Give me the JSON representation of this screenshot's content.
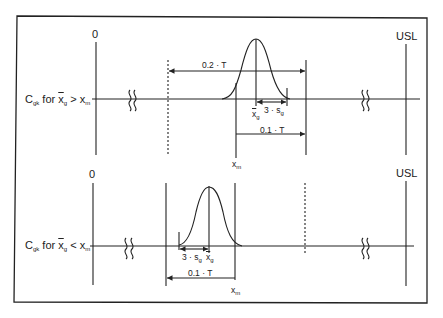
{
  "diagram": {
    "panels": [
      {
        "id": "top",
        "row_label": {
          "prefix": "C",
          "sub": "gk",
          "text": " for ",
          "xbar": "x",
          "xbar_sub": "g",
          "relation": " > ",
          "rhs": "x",
          "rhs_sub": "m"
        },
        "zero_label": "0",
        "usl_label": "USL",
        "dim_outer": "0.2 · T",
        "dim_inner": "0.1 · T",
        "sigma_label": "3 · s",
        "sigma_sub": "g",
        "mean_label": "x",
        "mean_sub": "g",
        "xm_label": "x",
        "xm_sub": "m"
      },
      {
        "id": "bottom",
        "row_label": {
          "prefix": "C",
          "sub": "gk",
          "text": " for ",
          "xbar": "x",
          "xbar_sub": "g",
          "relation": " < ",
          "rhs": "x",
          "rhs_sub": "m"
        },
        "zero_label": "0",
        "usl_label": "USL",
        "dim_inner": "0.1 · T",
        "sigma_label": "3 · s",
        "sigma_sub": "g",
        "mean_label": "x",
        "mean_sub": "g",
        "xm_label": "x",
        "xm_sub": "m"
      }
    ]
  }
}
